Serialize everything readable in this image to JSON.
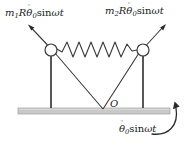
{
  "figure": {
    "background_color": "#ffffff",
    "stroke_color": "#3a3a3a",
    "base_fill_color": "#c8c8c8",
    "base_edge_color": "#9a9a9a",
    "node_fill_color": "#ffffff"
  },
  "labels": {
    "left_force": {
      "mass_symbol": "m",
      "mass_index": "1",
      "radius_symbol": "R",
      "theta_symbol": "θ",
      "theta_index": "0",
      "theta_accent": "¨",
      "trig": "sin",
      "omega_symbol": "ω",
      "time_symbol": "t",
      "full_text": "m₁Rθ̈₀sinωt"
    },
    "right_force": {
      "mass_symbol": "m",
      "mass_index": "2",
      "radius_symbol": "R",
      "theta_symbol": "θ",
      "theta_index": "0",
      "theta_accent": "¨",
      "trig": "sin",
      "omega_symbol": "ω",
      "time_symbol": "t",
      "full_text": "m₂Rθ̈₀sinωt"
    },
    "origin": {
      "text": "O"
    },
    "base_excitation": {
      "theta_symbol": "θ",
      "theta_index": "0",
      "theta_accent": "¨",
      "trig": "sin",
      "omega_symbol": "ω",
      "time_symbol": "t",
      "full_text": "θ̈₀sinωt"
    }
  },
  "geometry": {
    "base_bar": {
      "x": 18,
      "y": 108,
      "width": 152,
      "height": 6
    },
    "pivot_point": {
      "x": 103,
      "y": 108
    },
    "left_node": {
      "cx": 51,
      "cy": 50,
      "r": 6
    },
    "right_node": {
      "cx": 143,
      "cy": 50,
      "r": 6
    },
    "left_rod_foot": {
      "x": 51,
      "y": 108
    },
    "right_rod_foot": {
      "x": 143,
      "y": 108
    },
    "left_arrow_tip": {
      "x": 28,
      "y": 25
    },
    "right_arrow_tip": {
      "x": 166,
      "y": 24
    },
    "spring_coil_count": 8,
    "spring_amplitude": 8
  },
  "elements": {
    "left_mass_node": "circle-node-left",
    "right_mass_node": "circle-node-right",
    "spring": "coil-spring",
    "left_force_arrow": "arrow-up-left",
    "right_force_arrow": "arrow-up-right",
    "rotation_arrow": "curved-arrow-counterclockwise",
    "ground": "base-bar"
  }
}
